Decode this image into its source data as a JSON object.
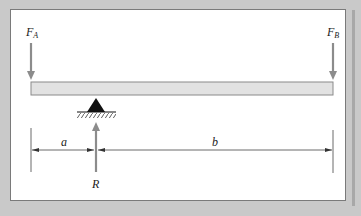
{
  "diagram": {
    "type": "beam-free-body",
    "labels": {
      "force_a": "F",
      "force_a_sub": "A",
      "force_b": "F",
      "force_b_sub": "B",
      "reaction": "R",
      "dim_a": "a",
      "dim_b": "b"
    },
    "colors": {
      "background": "#c9c9c9",
      "panel": "#ffffff",
      "beam_fill": "#e2e2e2",
      "beam_stroke": "#8a8a8a",
      "arrow": "#8c8c8c",
      "support": "#111111",
      "dimension_line": "#444444"
    },
    "elements": [
      {
        "name": "beam",
        "description": "horizontal beam spanning between forces F_A and F_B"
      },
      {
        "name": "force-a",
        "direction": "down",
        "position": "left end"
      },
      {
        "name": "force-b",
        "direction": "down",
        "position": "right end"
      },
      {
        "name": "pin-support",
        "position": "distance a from left end"
      },
      {
        "name": "reaction-r",
        "direction": "up",
        "position": "at support"
      },
      {
        "name": "dimension-a",
        "span": "left end to support"
      },
      {
        "name": "dimension-b",
        "span": "support to right end"
      }
    ]
  }
}
